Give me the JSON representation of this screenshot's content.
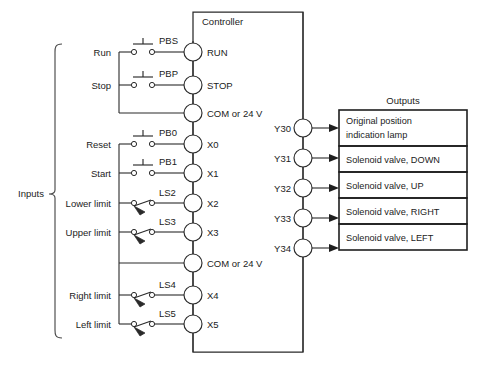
{
  "diagram": {
    "inputs_bracket_label": "Inputs",
    "controller_label": "Controller",
    "outputs_label": "Outputs",
    "caption": ""
  },
  "input_rows": [
    {
      "label": "Run",
      "switch_id": "PBS",
      "switch_type": "pushbutton",
      "terminal": "RUN"
    },
    {
      "label": "Stop",
      "switch_id": "PBP",
      "switch_type": "pushbutton",
      "terminal": "STOP"
    },
    {
      "label": "",
      "switch_id": "",
      "switch_type": "none",
      "terminal": "COM or 24 V"
    },
    {
      "label": "Reset",
      "switch_id": "PB0",
      "switch_type": "pushbutton",
      "terminal": "X0"
    },
    {
      "label": "Start",
      "switch_id": "PB1",
      "switch_type": "pushbutton",
      "terminal": "X1"
    },
    {
      "label": "Lower limit",
      "switch_id": "LS2",
      "switch_type": "limit",
      "terminal": "X2"
    },
    {
      "label": "Upper limit",
      "switch_id": "LS3",
      "switch_type": "limit",
      "terminal": "X3"
    },
    {
      "label": "",
      "switch_id": "",
      "switch_type": "none",
      "terminal": "COM or 24 V"
    },
    {
      "label": "Right limit",
      "switch_id": "LS4",
      "switch_type": "limit",
      "terminal": "X4"
    },
    {
      "label": "Left limit",
      "switch_id": "LS5",
      "switch_type": "limit",
      "terminal": "X5"
    }
  ],
  "output_rows": [
    {
      "terminal": "Y30",
      "text": "Original position indication lamp",
      "line1": "Original position",
      "line2": "indication lamp"
    },
    {
      "terminal": "Y31",
      "text": "Solenoid valve, DOWN",
      "line1": "Solenoid valve, DOWN",
      "line2": ""
    },
    {
      "terminal": "Y32",
      "text": "Solenoid valve, UP",
      "line1": "Solenoid valve, UP",
      "line2": ""
    },
    {
      "terminal": "Y33",
      "text": "Solenoid valve, RIGHT",
      "line1": "Solenoid valve, RIGHT",
      "line2": ""
    },
    {
      "terminal": "Y34",
      "text": "Solenoid valve, LEFT",
      "line1": "Solenoid valve, LEFT",
      "line2": ""
    }
  ],
  "colors": {
    "line": "#2a2a2a",
    "text": "#1b1b1b",
    "background": "#ffffff"
  }
}
